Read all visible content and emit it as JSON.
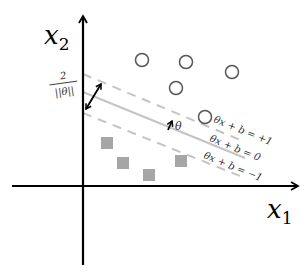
{
  "diagram": {
    "axes": {
      "x_label": "x",
      "x_subscript": "1",
      "y_label": "x",
      "y_subscript": "2"
    },
    "margin_label": {
      "numerator": "2",
      "denominator": "||θ||"
    },
    "normal_vector_label": "θ",
    "lines": [
      {
        "name": "positive-margin",
        "label": "θx + b = +1",
        "style": "dashed"
      },
      {
        "name": "decision-boundary",
        "label": "θx + b = 0",
        "style": "solid"
      },
      {
        "name": "negative-margin",
        "label": "θx + b = −1",
        "style": "dashed"
      }
    ],
    "positive_class": {
      "marker": "circle",
      "points": [
        [
          142,
          60
        ],
        [
          186,
          62
        ],
        [
          232,
          72
        ],
        [
          176,
          88
        ],
        [
          206,
          118
        ]
      ]
    },
    "negative_class": {
      "marker": "square",
      "points": [
        [
          107,
          143
        ],
        [
          123,
          163
        ],
        [
          149,
          175
        ],
        [
          180,
          161
        ]
      ]
    },
    "colors": {
      "axis": "#000000",
      "line": "#bdbdbd",
      "circle_stroke": "#555555",
      "square_fill": "#a6a6a6",
      "text": "#333333"
    }
  }
}
